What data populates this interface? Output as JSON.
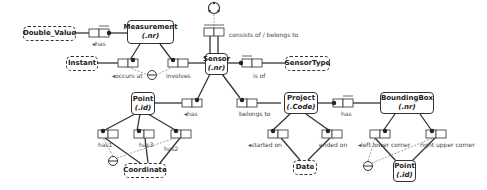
{
  "diagram": {
    "type": "ORM fact-type diagram",
    "entities": [
      {
        "id": "measurement",
        "name": "Measurement",
        "ref": "(.nr)"
      },
      {
        "id": "sensor",
        "name": "Sensor",
        "ref": "(.nr)"
      },
      {
        "id": "point",
        "name": "Point",
        "ref": "(.id)"
      },
      {
        "id": "project",
        "name": "Project",
        "ref": "(.Code)"
      },
      {
        "id": "boundingbox",
        "name": "BoundingBox",
        "ref": "(.nr)"
      },
      {
        "id": "point2",
        "name": "Point",
        "ref": "(.id)"
      }
    ],
    "value_types": [
      {
        "id": "double_value",
        "name": "Double_Value"
      },
      {
        "id": "instant",
        "name": "Instant"
      },
      {
        "id": "sensortype",
        "name": "SensorType"
      },
      {
        "id": "coordinate",
        "name": "Coordinate"
      },
      {
        "id": "date",
        "name": "Date"
      }
    ],
    "roles": {
      "has_value": "◂has",
      "occurs_at": "◂occurs at",
      "involves": "involves",
      "consists_of": "consists of / belongs to",
      "is_of": "is of",
      "point_has": "◂has",
      "belongs_to": "belongs to",
      "project_has": "has",
      "has1": "has1",
      "has2": "has2",
      "has3": "has3",
      "started_on": "◂started on",
      "ended_on": "ended on",
      "left_lower": "◂left lower corner",
      "right_upper": "right upper corner"
    }
  }
}
